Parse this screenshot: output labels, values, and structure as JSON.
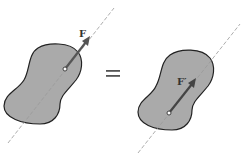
{
  "diagram": {
    "left": {
      "force_label": "F",
      "description": "Force F applied at point on line of action"
    },
    "equals_sign": "=",
    "right": {
      "force_label": "F′",
      "description": "Equivalent force F′ applied at different point on same line of action"
    },
    "colors": {
      "body_fill": "#aaaaaa",
      "body_stroke": "#222222",
      "arrow": "#555555",
      "line_of_action": "#999999",
      "background": "#ffffff"
    }
  }
}
